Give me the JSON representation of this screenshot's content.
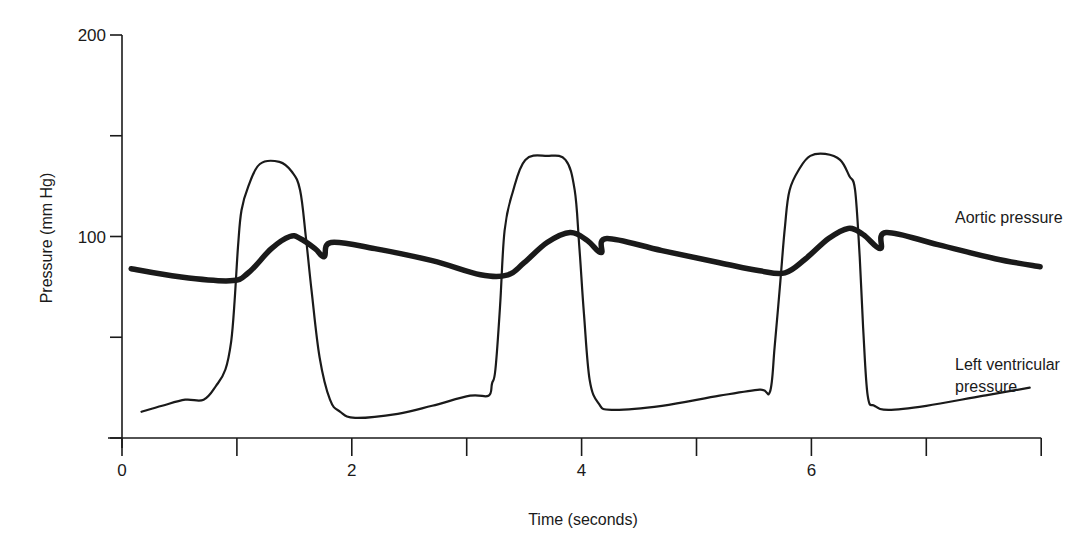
{
  "chart_data": {
    "type": "line",
    "title": "",
    "xlabel": "Time (seconds)",
    "ylabel": "Pressure (mm Hg)",
    "xlim": [
      0,
      8
    ],
    "ylim": [
      0,
      200
    ],
    "grid": false,
    "legend": "inline annotations",
    "x_ticks": [
      0,
      1,
      2,
      3,
      4,
      5,
      6,
      7,
      8
    ],
    "x_tick_labels": {
      "0": "0",
      "2": "2",
      "4": "4",
      "6": "6"
    },
    "y_ticks": [
      0,
      50,
      100,
      150,
      200
    ],
    "y_tick_labels": {
      "100": "100",
      "200": "200"
    },
    "series": [
      {
        "name": "Aortic pressure",
        "style": "thick",
        "color": "#1a1a1a",
        "points": [
          [
            0.08,
            84
          ],
          [
            0.5,
            80
          ],
          [
            0.94,
            78
          ],
          [
            1.1,
            82
          ],
          [
            1.3,
            94
          ],
          [
            1.46,
            100
          ],
          [
            1.55,
            99
          ],
          [
            1.68,
            94
          ],
          [
            1.76,
            90
          ],
          [
            1.82,
            97
          ],
          [
            2.2,
            94
          ],
          [
            2.7,
            88
          ],
          [
            3.12,
            81
          ],
          [
            3.36,
            81
          ],
          [
            3.5,
            87
          ],
          [
            3.7,
            97
          ],
          [
            3.9,
            102
          ],
          [
            4.05,
            98
          ],
          [
            4.17,
            92
          ],
          [
            4.22,
            99
          ],
          [
            4.7,
            93
          ],
          [
            5.2,
            87
          ],
          [
            5.55,
            83
          ],
          [
            5.77,
            82
          ],
          [
            5.95,
            89
          ],
          [
            6.15,
            99
          ],
          [
            6.32,
            104
          ],
          [
            6.45,
            101
          ],
          [
            6.6,
            94
          ],
          [
            6.65,
            102
          ],
          [
            7.1,
            96
          ],
          [
            7.6,
            89
          ],
          [
            7.99,
            85
          ]
        ]
      },
      {
        "name": "Left ventricular pressure",
        "style": "thin",
        "color": "#1a1a1a",
        "points": [
          [
            0.17,
            13
          ],
          [
            0.35,
            16
          ],
          [
            0.55,
            19
          ],
          [
            0.71,
            19
          ],
          [
            0.82,
            26
          ],
          [
            0.9,
            34
          ],
          [
            0.95,
            48
          ],
          [
            0.98,
            68
          ],
          [
            1.01,
            95
          ],
          [
            1.04,
            113
          ],
          [
            1.1,
            125
          ],
          [
            1.2,
            136
          ],
          [
            1.37,
            137
          ],
          [
            1.48,
            132
          ],
          [
            1.55,
            123
          ],
          [
            1.6,
            100
          ],
          [
            1.65,
            73
          ],
          [
            1.72,
            40
          ],
          [
            1.81,
            19
          ],
          [
            1.9,
            13
          ],
          [
            2.03,
            10
          ],
          [
            2.4,
            12
          ],
          [
            2.7,
            16
          ],
          [
            3.03,
            21
          ],
          [
            3.19,
            21
          ],
          [
            3.22,
            27
          ],
          [
            3.25,
            34
          ],
          [
            3.29,
            65
          ],
          [
            3.33,
            103
          ],
          [
            3.4,
            122
          ],
          [
            3.51,
            138
          ],
          [
            3.7,
            140
          ],
          [
            3.86,
            138
          ],
          [
            3.94,
            123
          ],
          [
            3.98,
            95
          ],
          [
            4.02,
            62
          ],
          [
            4.07,
            29
          ],
          [
            4.15,
            17
          ],
          [
            4.26,
            14
          ],
          [
            4.7,
            16
          ],
          [
            5.2,
            21
          ],
          [
            5.55,
            24
          ],
          [
            5.64,
            23
          ],
          [
            5.68,
            45
          ],
          [
            5.73,
            78
          ],
          [
            5.77,
            105
          ],
          [
            5.81,
            123
          ],
          [
            5.9,
            134
          ],
          [
            5.99,
            140
          ],
          [
            6.12,
            141
          ],
          [
            6.25,
            138
          ],
          [
            6.33,
            130
          ],
          [
            6.38,
            123
          ],
          [
            6.42,
            90
          ],
          [
            6.45,
            55
          ],
          [
            6.49,
            21
          ],
          [
            6.55,
            16
          ],
          [
            6.67,
            14
          ],
          [
            7.0,
            16
          ],
          [
            7.5,
            21
          ],
          [
            7.9,
            25
          ]
        ]
      }
    ],
    "annotations": [
      {
        "text": "Aortic pressure",
        "x": 7.25,
        "y": 107
      },
      {
        "text": "Left ventricular",
        "x": 7.25,
        "y": 49
      },
      {
        "text": "pressure",
        "x": 7.25,
        "y": 38
      }
    ]
  },
  "labels": {
    "xlabel": "Time (seconds)",
    "ylabel": "Pressure (mm Hg)",
    "annot_aortic": "Aortic pressure",
    "annot_lv_line1": "Left ventricular",
    "annot_lv_line2": "pressure"
  }
}
